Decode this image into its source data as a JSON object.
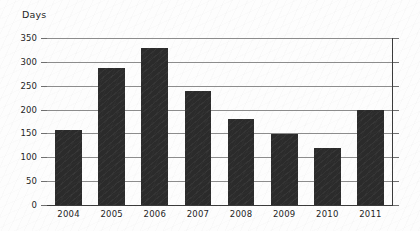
{
  "chart_data": {
    "type": "bar",
    "title": "",
    "subtitle": "",
    "xlabel": "",
    "ylabel": "Days",
    "categories": [
      "2004",
      "2005",
      "2006",
      "2007",
      "2008",
      "2009",
      "2010",
      "2011"
    ],
    "values": [
      157,
      287,
      330,
      240,
      180,
      148,
      120,
      200
    ],
    "series": [
      {
        "name": "Days",
        "values": [
          157,
          287,
          330,
          240,
          180,
          148,
          120,
          200
        ]
      }
    ],
    "ylim": [
      0,
      350
    ],
    "yticks": [
      0,
      50,
      100,
      150,
      200,
      250,
      300,
      350
    ],
    "ytick_labels": [
      "0",
      "50",
      "100",
      "150",
      "200",
      "250",
      "300",
      "350"
    ],
    "grid": true,
    "legend": false,
    "legend_position": "none",
    "bar_color": "#2b2b2b",
    "grid_color": "#8c8c8c",
    "axis_color": "#3a3a3a",
    "background_color": "#fdfdfd",
    "text_color": "#1d1d1d",
    "annotations": []
  }
}
